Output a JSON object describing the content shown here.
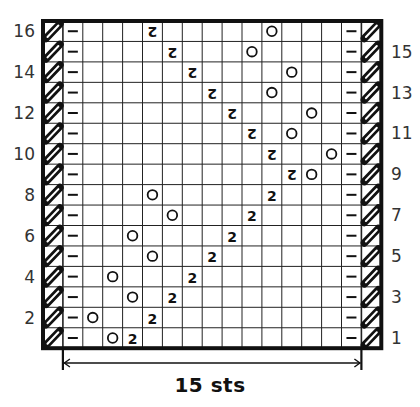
{
  "chart_data": {
    "type": "table",
    "width_label": "15 sts",
    "rows": 16,
    "stitch_columns": 15,
    "edge_columns": {
      "left": "slip-edge",
      "right": "slip-edge"
    },
    "row_labels": {
      "left": [
        "16",
        "14",
        "12",
        "10",
        "8",
        "6",
        "4",
        "2"
      ],
      "right": [
        "15",
        "13",
        "11",
        "9",
        "7",
        "5",
        "3",
        "1"
      ]
    },
    "legend_symbols": {
      "slash": "edge stitch (hatched slash)",
      "dash": "–",
      "yo": "O",
      "dec": "2",
      "dec_mirrored": "2 (mirrored)"
    },
    "symbols": {
      "dash": "–",
      "yo": "O",
      "dec": "2"
    },
    "cells": [
      {
        "row": 16,
        "items": [
          {
            "col": 5,
            "sym": "dec",
            "mirrored": true
          },
          {
            "col": 11,
            "sym": "yo"
          }
        ]
      },
      {
        "row": 15,
        "items": [
          {
            "col": 6,
            "sym": "dec",
            "mirrored": true
          },
          {
            "col": 10,
            "sym": "yo"
          }
        ]
      },
      {
        "row": 14,
        "items": [
          {
            "col": 7,
            "sym": "dec",
            "mirrored": true
          },
          {
            "col": 12,
            "sym": "yo"
          }
        ]
      },
      {
        "row": 13,
        "items": [
          {
            "col": 8,
            "sym": "dec",
            "mirrored": true
          },
          {
            "col": 11,
            "sym": "yo"
          }
        ]
      },
      {
        "row": 12,
        "items": [
          {
            "col": 9,
            "sym": "dec",
            "mirrored": true
          },
          {
            "col": 13,
            "sym": "yo"
          }
        ]
      },
      {
        "row": 11,
        "items": [
          {
            "col": 10,
            "sym": "dec",
            "mirrored": true
          },
          {
            "col": 12,
            "sym": "yo"
          }
        ]
      },
      {
        "row": 10,
        "items": [
          {
            "col": 11,
            "sym": "dec",
            "mirrored": true
          },
          {
            "col": 14,
            "sym": "yo"
          }
        ]
      },
      {
        "row": 9,
        "items": [
          {
            "col": 12,
            "sym": "dec",
            "mirrored": true
          },
          {
            "col": 13,
            "sym": "yo"
          }
        ]
      },
      {
        "row": 8,
        "items": [
          {
            "col": 5,
            "sym": "yo"
          },
          {
            "col": 11,
            "sym": "dec",
            "mirrored": false
          }
        ]
      },
      {
        "row": 7,
        "items": [
          {
            "col": 6,
            "sym": "yo"
          },
          {
            "col": 10,
            "sym": "dec",
            "mirrored": false
          }
        ]
      },
      {
        "row": 6,
        "items": [
          {
            "col": 4,
            "sym": "yo"
          },
          {
            "col": 9,
            "sym": "dec",
            "mirrored": false
          }
        ]
      },
      {
        "row": 5,
        "items": [
          {
            "col": 5,
            "sym": "yo"
          },
          {
            "col": 8,
            "sym": "dec",
            "mirrored": false
          }
        ]
      },
      {
        "row": 4,
        "items": [
          {
            "col": 3,
            "sym": "yo"
          },
          {
            "col": 7,
            "sym": "dec",
            "mirrored": false
          }
        ]
      },
      {
        "row": 3,
        "items": [
          {
            "col": 4,
            "sym": "yo"
          },
          {
            "col": 6,
            "sym": "dec",
            "mirrored": false
          }
        ]
      },
      {
        "row": 2,
        "items": [
          {
            "col": 2,
            "sym": "yo"
          },
          {
            "col": 5,
            "sym": "dec",
            "mirrored": false
          }
        ]
      },
      {
        "row": 1,
        "items": [
          {
            "col": 3,
            "sym": "yo"
          },
          {
            "col": 4,
            "sym": "dec",
            "mirrored": false
          }
        ]
      }
    ],
    "dash_columns": [
      1,
      15
    ]
  },
  "caption": "15 sts"
}
